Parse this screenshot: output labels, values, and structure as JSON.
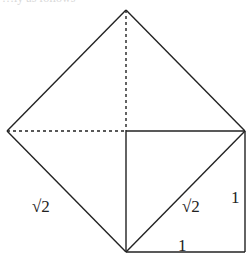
{
  "figure": {
    "top_cutoff_text": "…ly as follows",
    "points": {
      "apex_top": [
        126,
        10
      ],
      "left": [
        7,
        131
      ],
      "center_top": [
        126,
        131
      ],
      "right": [
        245,
        131
      ],
      "bottom": [
        126,
        252
      ],
      "bottom_right": [
        245,
        252
      ]
    },
    "labels": {
      "left_side": "√2",
      "diagonal": "√2",
      "right_side": "1",
      "bottom_side": "1"
    },
    "colors": {
      "line": "#222222",
      "background": "#ffffff"
    }
  }
}
